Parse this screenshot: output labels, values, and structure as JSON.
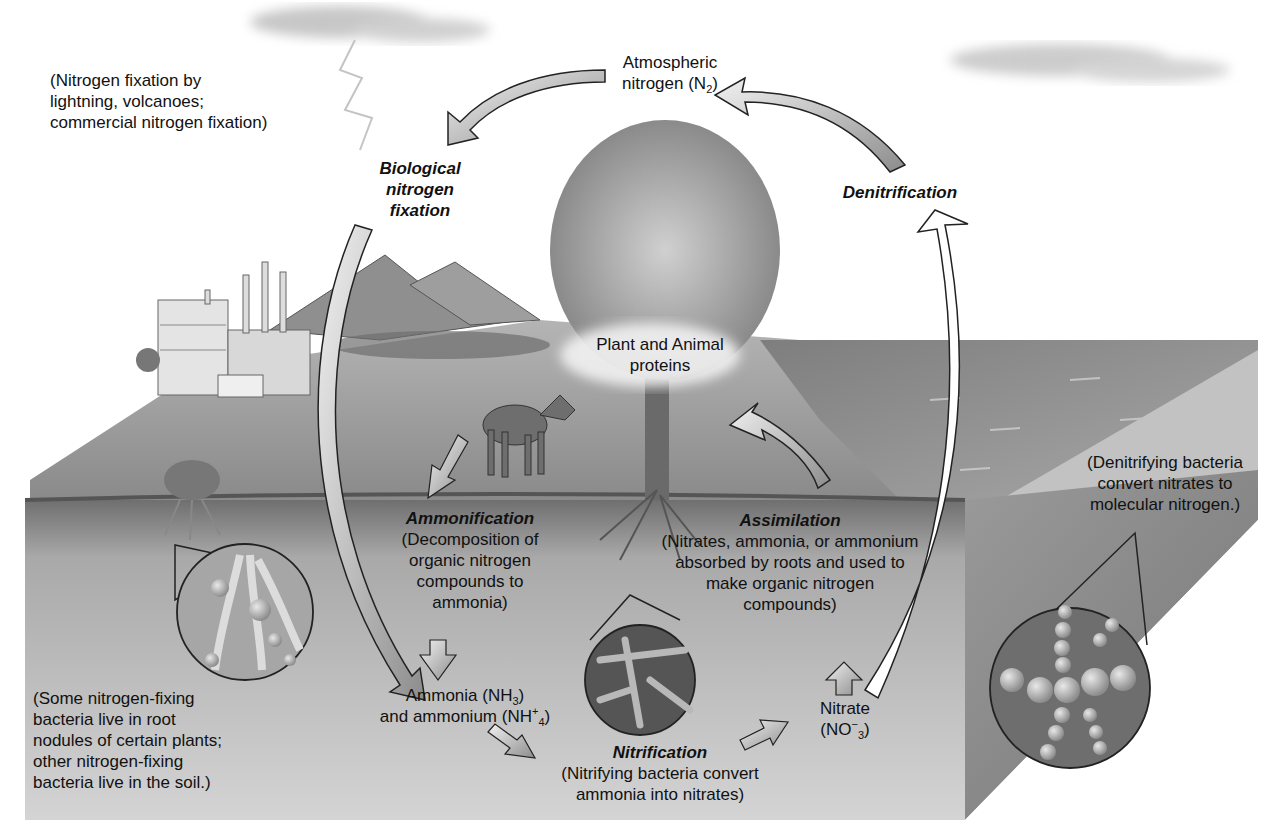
{
  "diagram": {
    "topic": "Nitrogen cycle",
    "colors": {
      "sky": "#ffffff",
      "ground_top": "#9c9c9c",
      "soil": "#c8c8c8",
      "soil_dark": "#7a7a7a",
      "water": "#8e8e8e",
      "arrow_fill": "#bdbdbd",
      "arrow_stroke": "#222222"
    },
    "nodes": {
      "atmospheric": {
        "line1": "Atmospheric",
        "line2_pre": "nitrogen (N",
        "line2_sub": "2",
        "line2_post": ")"
      },
      "proteins": {
        "line1": "Plant and Animal",
        "line2": "proteins"
      },
      "ammonia": {
        "line1_pre": "Ammonia (NH",
        "line1_sub": "3",
        "line1_post": ")",
        "line2_pre": "and ammonium (NH",
        "line2_sup": "+",
        "line2_sub": "4",
        "line2_post": ")"
      },
      "nitrate": {
        "line1": "Nitrate",
        "line2_pre": "(NO",
        "line2_sup": "−",
        "line2_sub": "3",
        "line2_post": ")"
      }
    },
    "processes": {
      "biological_fixation": {
        "title_lines": [
          "Biological",
          "nitrogen",
          "fixation"
        ]
      },
      "denitrification": {
        "title": "Denitrification"
      },
      "ammonification": {
        "title": "Ammonification",
        "desc_lines": [
          "(Decomposition of",
          "organic nitrogen",
          "compounds to",
          "ammonia)"
        ]
      },
      "assimilation": {
        "title": "Assimilation",
        "desc_lines": [
          "(Nitrates, ammonia, or ammonium",
          "absorbed by roots and used to",
          "make organic nitrogen",
          "compounds)"
        ]
      },
      "nitrification": {
        "title": "Nitrification",
        "desc_lines": [
          "(Nitrifying bacteria convert",
          "ammonia into nitrates)"
        ]
      }
    },
    "notes": {
      "lightning": [
        "(Nitrogen fixation by",
        "lightning, volcanoes;",
        "commercial nitrogen fixation)"
      ],
      "root_nodules": [
        "(Some nitrogen-fixing",
        "bacteria live in root",
        "nodules of certain plants;",
        "other nitrogen-fixing",
        "bacteria live in the soil.)"
      ],
      "denitrifying": [
        "(Denitrifying bacteria",
        "convert nitrates to",
        "molecular nitrogen.)"
      ]
    },
    "illustrations": [
      "cloud-left",
      "cloud-right",
      "lightning-bolt",
      "factory",
      "volcano-mountains",
      "tree",
      "deer",
      "shrub-with-roots",
      "ocean",
      "root-nodule-magnifier",
      "nitrifying-bacteria-magnifier",
      "denitrifying-bacteria-magnifier"
    ]
  }
}
